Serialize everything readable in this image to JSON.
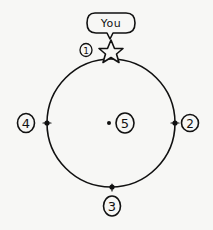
{
  "diagram": {
    "ink_color": "#111111",
    "background_color": "#f7f7f5",
    "circle": {
      "cx": 111,
      "cy": 123,
      "r": 64
    },
    "you_marker": {
      "bubble_text": "You",
      "shape": "star-icon",
      "position": "top of circle"
    },
    "points": [
      {
        "id": 1,
        "label": "1",
        "position": "top (star)"
      },
      {
        "id": 2,
        "label": "2",
        "position": "right"
      },
      {
        "id": 3,
        "label": "3",
        "position": "bottom"
      },
      {
        "id": 4,
        "label": "4",
        "position": "left"
      },
      {
        "id": 5,
        "label": "5",
        "position": "center"
      }
    ]
  }
}
